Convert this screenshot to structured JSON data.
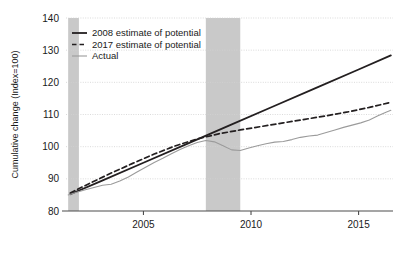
{
  "chart_data": {
    "type": "line",
    "title": "",
    "xlabel": "",
    "ylabel": "Cumulative change (Index=100)",
    "xlim": [
      2001.4,
      2016.6
    ],
    "ylim": [
      80,
      140
    ],
    "grid": true,
    "grid_axis": "y",
    "legend_position": "top-left-inside",
    "yticks": [
      80,
      90,
      100,
      110,
      120,
      130,
      140
    ],
    "ytick_labels": [
      "80",
      "90",
      "100",
      "110",
      "120",
      "130",
      "140"
    ],
    "xticks": [
      2005,
      2010,
      2015
    ],
    "xtick_labels": [
      "2005",
      "2010",
      "2015"
    ],
    "shaded_regions": [
      {
        "name": "recession-2001",
        "x_start": 2001.5,
        "x_end": 2002.0,
        "color": "#c9c9c9"
      },
      {
        "name": "recession-2008",
        "x_start": 2007.9,
        "x_end": 2009.5,
        "color": "#c9c9c9"
      }
    ],
    "series": [
      {
        "name": "2008 estimate of potential",
        "style": "solid",
        "color": "#231f20",
        "width": 1.8,
        "x": [
          2001.6,
          2003.0,
          2005.0,
          2007.0,
          2009.0,
          2011.0,
          2013.0,
          2015.0,
          2016.5
        ],
        "values": [
          85.2,
          89.2,
          95.0,
          100.8,
          106.6,
          112.4,
          118.2,
          124.0,
          128.4
        ]
      },
      {
        "name": "2017 estimate of potential",
        "style": "dashed",
        "color": "#231f20",
        "width": 1.7,
        "x": [
          2001.6,
          2002.5,
          2003.5,
          2004.5,
          2005.5,
          2006.5,
          2007.5,
          2008.5,
          2009.5,
          2010.5,
          2011.5,
          2012.5,
          2013.5,
          2014.5,
          2015.5,
          2016.5
        ],
        "values": [
          85.6,
          88.6,
          91.8,
          94.8,
          97.7,
          100.3,
          102.4,
          104.0,
          105.2,
          106.3,
          107.4,
          108.5,
          109.6,
          110.8,
          112.2,
          113.8
        ]
      },
      {
        "name": "Actual",
        "style": "solid",
        "color": "#9b9b9b",
        "width": 1.1,
        "x": [
          2001.5,
          2001.9,
          2002.3,
          2002.7,
          2003.1,
          2003.5,
          2003.9,
          2004.3,
          2004.7,
          2005.1,
          2005.5,
          2005.9,
          2006.3,
          2006.7,
          2007.1,
          2007.5,
          2007.9,
          2008.3,
          2008.7,
          2009.1,
          2009.5,
          2009.9,
          2010.3,
          2010.7,
          2011.1,
          2011.5,
          2011.9,
          2012.3,
          2012.7,
          2013.1,
          2013.5,
          2013.9,
          2014.3,
          2014.7,
          2015.1,
          2015.5,
          2015.9,
          2016.3,
          2016.5
        ],
        "values": [
          85.0,
          85.8,
          86.6,
          87.3,
          88.0,
          88.3,
          89.3,
          90.6,
          92.1,
          93.6,
          95.1,
          96.4,
          97.8,
          99.1,
          100.3,
          101.3,
          101.9,
          101.5,
          100.3,
          99.0,
          98.8,
          99.6,
          100.3,
          100.9,
          101.4,
          101.6,
          102.2,
          102.9,
          103.3,
          103.6,
          104.4,
          105.2,
          106.0,
          106.7,
          107.4,
          108.3,
          109.6,
          110.8,
          111.3
        ]
      }
    ]
  },
  "legend": {
    "items": [
      {
        "label": "2008 estimate of potential",
        "swatch": "solid-line-swatch"
      },
      {
        "label": "2017 estimate of potential",
        "swatch": "dashed-line-swatch"
      },
      {
        "label": "Actual",
        "swatch": "thin-line-swatch"
      }
    ]
  },
  "colors": {
    "estimate_line": "#231f20",
    "actual_line": "#9b9b9b",
    "recession_band": "#c9c9c9",
    "gridline": "#d2d2d2",
    "axis": "#4d4d4d",
    "background": "#ffffff"
  }
}
